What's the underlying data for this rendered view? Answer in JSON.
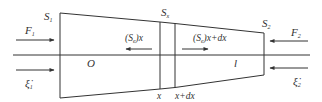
{
  "diagram": {
    "type": "tapered-rod-longitudinal-vibration",
    "colors": {
      "stroke": "#333333",
      "background": "#ffffff"
    },
    "body": {
      "left_end": {
        "x": 60,
        "top": 13,
        "bottom": 98
      },
      "right_end": {
        "x": 264,
        "top": 33,
        "bottom": 75
      }
    },
    "axis": {
      "y": 55,
      "x_start": 13,
      "x_end": 310
    },
    "sections": [
      {
        "x": 160,
        "label": "x"
      },
      {
        "x": 175,
        "label": "x+dx"
      }
    ],
    "labels": {
      "s1_main": "S",
      "s1_sub": "1",
      "sx_main": "S",
      "sx_sub": "x",
      "s2_main": "S",
      "s2_sub": "2",
      "f1_main": "F",
      "f1_sub": "1",
      "f2_main": "F",
      "f2_sub": "2",
      "xi1_main": "ξ̇",
      "xi1_sub": "1",
      "xi2_main": "ξ̇",
      "xi2_sub": "2",
      "origin": "O",
      "length": "l",
      "force_left_pre": "(S",
      "force_left_sub": "e",
      "force_left_post": ")x",
      "force_right_pre": "(S",
      "force_right_sub": "e",
      "force_right_post": ")x+dx",
      "section_x": "x",
      "section_xdx": "x+dx"
    },
    "arrows": [
      {
        "name": "F1",
        "from": [
          16,
          40
        ],
        "to": [
          54,
          40
        ],
        "direction": "right"
      },
      {
        "name": "xi1-dot",
        "from": [
          16,
          70
        ],
        "to": [
          54,
          70
        ],
        "direction": "right"
      },
      {
        "name": "F2",
        "from": [
          308,
          41
        ],
        "to": [
          270,
          41
        ],
        "direction": "left"
      },
      {
        "name": "xi2-dot",
        "from": [
          308,
          68
        ],
        "to": [
          270,
          68
        ],
        "direction": "left"
      },
      {
        "name": "Se-x",
        "from": [
          152,
          49
        ],
        "to": [
          126,
          49
        ],
        "direction": "left"
      },
      {
        "name": "Se-x-dx",
        "from": [
          182,
          49
        ],
        "to": [
          208,
          49
        ],
        "direction": "right"
      }
    ]
  }
}
